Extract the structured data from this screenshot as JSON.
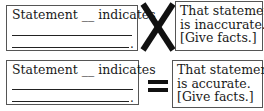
{
  "rows": [
    {
      "statement": {
        "text": "Statement __ indicates",
        "blank_lines": 2,
        "end_punctuation": "."
      },
      "operator": {
        "symbol": "not-equal-x",
        "meaning": "X"
      },
      "response": {
        "lines": [
          "That statement",
          "is inaccurate.",
          "[Give facts.]"
        ]
      }
    },
    {
      "statement": {
        "text": "Statement __ indicates",
        "blank_lines": 2,
        "end_punctuation": "."
      },
      "operator": {
        "symbol": "equals",
        "meaning": "="
      },
      "response": {
        "lines": [
          "That statement",
          "is accurate.",
          "[Give facts.]"
        ]
      }
    }
  ]
}
